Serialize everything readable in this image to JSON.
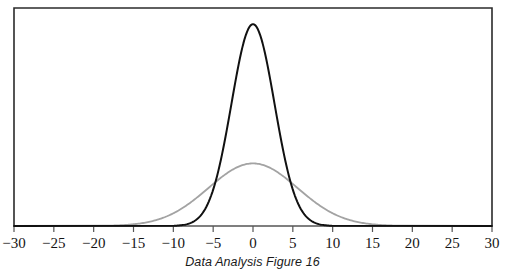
{
  "figure": {
    "caption": "Data Analysis Figure 16",
    "frame": {
      "left": 14,
      "right": 492,
      "top": 8,
      "bottom": 226,
      "border_color": "#2b2b2b"
    }
  },
  "chart_data": {
    "type": "line",
    "title": "",
    "subtitle": "",
    "caption": "Data Analysis Figure 16",
    "xlabel": "",
    "ylabel": "",
    "xlim": [
      -30,
      30
    ],
    "ylim": [
      0,
      1.08
    ],
    "grid": false,
    "legend": "none",
    "axis": {
      "tick_values": [
        -30,
        -25,
        -20,
        -15,
        -10,
        -5,
        0,
        5,
        10,
        15,
        20,
        25,
        30
      ],
      "tick_labels": [
        "−30",
        "−25",
        "−20",
        "−15",
        "−10",
        "−5",
        "0",
        "5",
        "10",
        "15",
        "20",
        "25",
        "30"
      ],
      "tick_direction": "outward",
      "axis_color": "#555555"
    },
    "series": [
      {
        "name": "narrow-normal-curve",
        "distribution": "normal",
        "mean": 0,
        "sigma": 2.7,
        "peak_height": 1.0,
        "color": "#111111",
        "line_width": 2.0,
        "x": [
          -12,
          -11,
          -10,
          -9,
          -8,
          -7,
          -6,
          -5,
          -4,
          -3,
          -2,
          -1,
          0,
          1,
          2,
          3,
          4,
          5,
          6,
          7,
          8,
          9,
          10,
          11,
          12
        ],
        "values": [
          0.0,
          0.0002,
          0.001,
          0.004,
          0.013,
          0.035,
          0.084,
          0.177,
          0.329,
          0.538,
          0.78,
          0.953,
          1.0,
          0.953,
          0.78,
          0.538,
          0.329,
          0.177,
          0.084,
          0.035,
          0.013,
          0.004,
          0.001,
          0.0002,
          0.0
        ]
      },
      {
        "name": "wide-normal-curve",
        "distribution": "normal",
        "mean": 0,
        "sigma": 5.6,
        "peak_height": 0.31,
        "color": "#a3a3a3",
        "line_width": 1.8,
        "x": [
          -18,
          -16,
          -14,
          -12,
          -10,
          -8,
          -6,
          -4,
          -2,
          0,
          2,
          4,
          6,
          8,
          10,
          12,
          14,
          16,
          18
        ],
        "values": [
          0.011,
          0.021,
          0.038,
          0.065,
          0.1,
          0.143,
          0.187,
          0.23,
          0.27,
          0.31,
          0.27,
          0.23,
          0.187,
          0.143,
          0.1,
          0.065,
          0.038,
          0.021,
          0.011
        ]
      }
    ]
  }
}
